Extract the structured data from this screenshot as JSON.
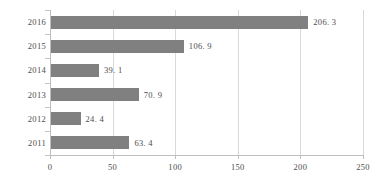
{
  "chart_data": {
    "type": "bar",
    "orientation": "horizontal",
    "title": "",
    "xlabel": "",
    "ylabel": "",
    "categories": [
      "2016",
      "2015",
      "2014",
      "2013",
      "2012",
      "2011"
    ],
    "values": [
      206.3,
      106.9,
      39.1,
      70.9,
      24.4,
      63.4
    ],
    "value_labels": [
      "206. 3",
      "106. 9",
      "39. 1",
      "70. 9",
      "24. 4",
      "63. 4"
    ],
    "xlim": [
      0,
      250
    ],
    "xticks": [
      0,
      50,
      100,
      150,
      200,
      250
    ],
    "xtick_labels": [
      "0",
      "50",
      "100",
      "150",
      "200",
      "250"
    ],
    "grid": true,
    "grid_axis": "x",
    "legend": false,
    "series": [
      {
        "name": "",
        "color": "#808080",
        "values": [
          206.3,
          106.9,
          39.1,
          70.9,
          24.4,
          63.4
        ]
      }
    ]
  },
  "style": {
    "bar_color": "#808080",
    "grid_color": "#d9d9d9",
    "axis_color": "#bfbfbf",
    "text_color": "#4d4d4d",
    "background": "#ffffff"
  }
}
